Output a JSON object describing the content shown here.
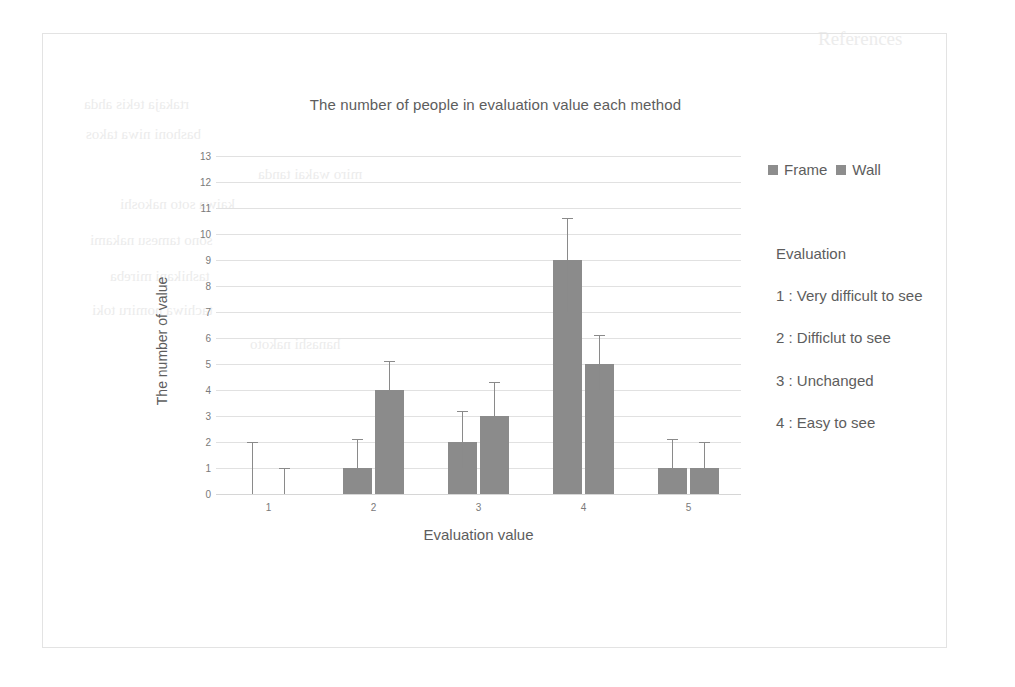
{
  "chart_data": {
    "type": "bar",
    "title": "The number of people in evaluation value each method",
    "xlabel": "Evaluation value",
    "ylabel": "The number of value",
    "categories": [
      "1",
      "2",
      "3",
      "4",
      "5"
    ],
    "ylim": [
      0,
      13
    ],
    "yticks": [
      0,
      1,
      2,
      3,
      4,
      5,
      6,
      7,
      8,
      9,
      10,
      11,
      12,
      13
    ],
    "grid": true,
    "legend_position": "top-right",
    "series": [
      {
        "name": "Frame",
        "color": "#8b8b8b",
        "values": [
          0,
          1,
          2,
          9,
          1
        ],
        "error_low": [
          0,
          0,
          1,
          2,
          0
        ],
        "error_high": [
          2,
          1.1,
          1.2,
          1.6,
          1.1
        ]
      },
      {
        "name": "Wall",
        "color": "#8b8b8b",
        "values": [
          0,
          4,
          3,
          5,
          1
        ],
        "error_low": [
          0,
          0,
          0,
          1,
          0
        ],
        "error_high": [
          1,
          1.1,
          1.3,
          1.1,
          1
        ]
      }
    ]
  },
  "legend": {
    "items": [
      {
        "label": "Frame",
        "swatch": "legend-swatch-frame"
      },
      {
        "label": "Wall",
        "swatch": "legend-swatch-wall"
      }
    ]
  },
  "side_notes": {
    "heading": "Evaluation",
    "items": [
      "1 : Very difficult to see",
      "2 : Difficlut to see",
      "3 : Unchanged",
      "4 : Easy to see"
    ]
  },
  "colors": {
    "bar": "#8b8b8b",
    "grid": "#e1e1e1",
    "text": "#5d5d5d",
    "tick_text": "#7a7a7a",
    "panel_border": "#e3e3e3"
  },
  "background_bleed": [
    {
      "text": "References",
      "x": 818,
      "y": 28,
      "size": 19,
      "mirror": false
    },
    {
      "text": "rtakaja tekis ahda",
      "x": 84,
      "y": 96,
      "size": 15,
      "mirror": true
    },
    {
      "text": "bashoni niwa takos",
      "x": 86,
      "y": 126,
      "size": 15,
      "mirror": true
    },
    {
      "text": "miro wakai tanda",
      "x": 258,
      "y": 166,
      "size": 15,
      "mirror": true
    },
    {
      "text": "kaiwa soto nakoshi",
      "x": 120,
      "y": 196,
      "size": 15,
      "mirror": true
    },
    {
      "text": "sono tamesu nakami",
      "x": 90,
      "y": 232,
      "size": 15,
      "mirror": true
    },
    {
      "text": "tashikani mireba",
      "x": 110,
      "y": 268,
      "size": 15,
      "mirror": true
    },
    {
      "text": "tachiwa nomiru toki",
      "x": 92,
      "y": 302,
      "size": 15,
      "mirror": true
    },
    {
      "text": "hanashi nakoto",
      "x": 250,
      "y": 336,
      "size": 15,
      "mirror": true
    }
  ]
}
